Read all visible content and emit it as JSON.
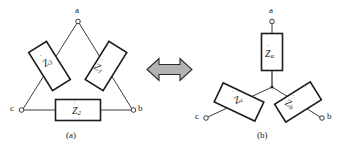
{
  "figure": {
    "title_caption_a": "(a)",
    "title_caption_b": "(b)",
    "arrow": {
      "name": "double-headed-arrow",
      "fill": "#b3b3b3",
      "stroke": "#2b2b2b"
    },
    "colors": {
      "line": "#262626",
      "text": "#1a1a1a",
      "background": "#ffffff",
      "box_fill": "#ffffff"
    },
    "delta": {
      "name": "delta-connection",
      "terminals": [
        {
          "id": "a",
          "label": "a"
        },
        {
          "id": "b",
          "label": "b"
        },
        {
          "id": "c",
          "label": "c"
        }
      ],
      "impedances": [
        {
          "id": "z1",
          "symbol": "Z",
          "subscript": "1",
          "dot": "˙",
          "position": "right-leg"
        },
        {
          "id": "z2",
          "symbol": "Z",
          "subscript": "2",
          "dot": "˙",
          "position": "bottom-leg"
        },
        {
          "id": "z3",
          "symbol": "Z",
          "subscript": "3",
          "dot": "˙",
          "position": "left-leg"
        }
      ]
    },
    "wye": {
      "name": "wye-connection",
      "terminals": [
        {
          "id": "a",
          "label": "a"
        },
        {
          "id": "b",
          "label": "b"
        },
        {
          "id": "c",
          "label": "c"
        }
      ],
      "impedances": [
        {
          "id": "za",
          "symbol": "Z",
          "subscript": "a",
          "dot": "˙",
          "position": "top-branch"
        },
        {
          "id": "zb",
          "symbol": "Z",
          "subscript": "b",
          "dot": "˙",
          "position": "right-branch"
        },
        {
          "id": "zc",
          "symbol": "Z",
          "subscript": "c",
          "dot": "˙",
          "position": "left-branch"
        }
      ]
    }
  }
}
